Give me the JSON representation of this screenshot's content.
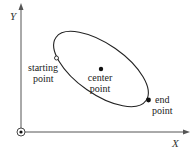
{
  "diagram": {
    "type": "ellipse-arc-definition",
    "axes": {
      "x_label": "X",
      "y_label": "Y",
      "origin_marker": "circle-with-dot",
      "color": "#555555"
    },
    "ellipse": {
      "stroke_color": "#222222",
      "orientation": "tilted, major axis running upper-left to lower-right"
    },
    "points": {
      "starting_point": {
        "line1": "starting",
        "line2": "point",
        "marker": "open-circle"
      },
      "center_point": {
        "line1": "center",
        "line2": "point",
        "marker": "filled-dot"
      },
      "end_point": {
        "line1": "end",
        "line2": "point",
        "marker": "filled-dot"
      }
    }
  }
}
